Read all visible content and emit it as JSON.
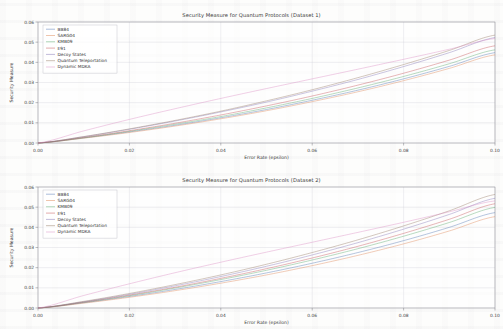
{
  "page": {
    "background": "#fdfdfc"
  },
  "figures": [
    {
      "id": "dataset-1",
      "title": "Security Measure for Quantum Protocols (Dataset 1)",
      "xlabel": "Error Rate (epsilon)",
      "ylabel": "Security Measure"
    },
    {
      "id": "dataset-2",
      "title": "Security Measure for Quantum Protocols (Dataset 2)",
      "xlabel": "Error Rate (epsilon)",
      "ylabel": "Security Measure"
    }
  ],
  "chart_data": [
    {
      "type": "line",
      "title": "Security Measure for Quantum Protocols (Dataset 1)",
      "xlabel": "Error Rate (epsilon)",
      "ylabel": "Security Measure",
      "xlim": [
        0.0,
        0.1
      ],
      "ylim": [
        0.0,
        0.06
      ],
      "xticks": [
        0.0,
        0.02,
        0.04,
        0.06,
        0.08,
        0.1
      ],
      "xticklabels": [
        "0.00",
        "0.02",
        "0.04",
        "0.06",
        "0.08",
        "0.10"
      ],
      "yticks": [
        0.0,
        0.01,
        0.02,
        0.03,
        0.04,
        0.05,
        0.06
      ],
      "yticklabels": [
        "0.00",
        "0.01",
        "0.02",
        "0.03",
        "0.04",
        "0.05",
        "0.06"
      ],
      "grid": true,
      "legend_position": "upper left",
      "x": [
        0.0,
        0.01,
        0.02,
        0.03,
        0.04,
        0.05,
        0.06,
        0.07,
        0.08,
        0.09,
        0.1
      ],
      "series": [
        {
          "name": "BB84",
          "color": "#4c72b0",
          "values": [
            0.0,
            0.0025,
            0.0055,
            0.0088,
            0.0125,
            0.0166,
            0.0212,
            0.0262,
            0.0318,
            0.038,
            0.0448
          ]
        },
        {
          "name": "SARG04",
          "color": "#dd8452",
          "values": [
            0.0,
            0.0024,
            0.0052,
            0.0084,
            0.012,
            0.016,
            0.0205,
            0.0254,
            0.0309,
            0.037,
            0.0437
          ]
        },
        {
          "name": "KMB09",
          "color": "#55a868",
          "values": [
            0.0,
            0.0026,
            0.0058,
            0.0093,
            0.0131,
            0.0174,
            0.0221,
            0.0273,
            0.033,
            0.0393,
            0.0462
          ]
        },
        {
          "name": "E91",
          "color": "#c44e52",
          "values": [
            0.0,
            0.0028,
            0.0061,
            0.0098,
            0.0139,
            0.0184,
            0.0233,
            0.0287,
            0.0346,
            0.0411,
            0.0482
          ]
        },
        {
          "name": "Decoy States",
          "color": "#8172b3",
          "values": [
            0.0,
            0.0031,
            0.0068,
            0.0109,
            0.0154,
            0.0203,
            0.0257,
            0.0315,
            0.0379,
            0.0448,
            0.0523
          ]
        },
        {
          "name": "Quantum Teleportation",
          "color": "#937860",
          "values": [
            0.0,
            0.0032,
            0.007,
            0.0112,
            0.0158,
            0.0209,
            0.0264,
            0.0324,
            0.0389,
            0.0459,
            0.0535
          ]
        },
        {
          "name": "Dynamic MDKA",
          "color": "#da8bc3",
          "values": [
            0.0,
            0.006,
            0.0117,
            0.017,
            0.0221,
            0.027,
            0.0318,
            0.0366,
            0.0415,
            0.0465,
            0.0518
          ]
        }
      ]
    },
    {
      "type": "line",
      "title": "Security Measure for Quantum Protocols (Dataset 2)",
      "xlabel": "Error Rate (epsilon)",
      "ylabel": "Security Measure",
      "xlim": [
        0.0,
        0.1
      ],
      "ylim": [
        0.0,
        0.06
      ],
      "xticks": [
        0.0,
        0.02,
        0.04,
        0.06,
        0.08,
        0.1
      ],
      "xticklabels": [
        "0.00",
        "0.02",
        "0.04",
        "0.06",
        "0.08",
        "0.10"
      ],
      "yticks": [
        0.0,
        0.01,
        0.02,
        0.03,
        0.04,
        0.05,
        0.06
      ],
      "yticklabels": [
        "0.00",
        "0.01",
        "0.02",
        "0.03",
        "0.04",
        "0.05",
        "0.06"
      ],
      "grid": true,
      "legend_position": "upper left",
      "x": [
        0.0,
        0.01,
        0.02,
        0.03,
        0.04,
        0.05,
        0.06,
        0.07,
        0.08,
        0.09,
        0.1
      ],
      "series": [
        {
          "name": "BB84",
          "color": "#4c72b0",
          "values": [
            0.0,
            0.0026,
            0.0057,
            0.0092,
            0.0131,
            0.0174,
            0.0222,
            0.0275,
            0.0334,
            0.04,
            0.0473
          ]
        },
        {
          "name": "SARG04",
          "color": "#dd8452",
          "values": [
            0.0,
            0.0024,
            0.0053,
            0.0086,
            0.0123,
            0.0164,
            0.021,
            0.0261,
            0.0318,
            0.0382,
            0.0453
          ]
        },
        {
          "name": "KMB09",
          "color": "#55a868",
          "values": [
            0.0,
            0.0028,
            0.0061,
            0.0099,
            0.0141,
            0.0187,
            0.0238,
            0.0294,
            0.0356,
            0.0424,
            0.0499
          ]
        },
        {
          "name": "E91",
          "color": "#c44e52",
          "values": [
            0.0,
            0.0029,
            0.0064,
            0.0103,
            0.0147,
            0.0195,
            0.0248,
            0.0306,
            0.037,
            0.044,
            0.0517
          ]
        },
        {
          "name": "Decoy States",
          "color": "#8172b3",
          "values": [
            0.0,
            0.0031,
            0.0068,
            0.011,
            0.0156,
            0.0207,
            0.0263,
            0.0324,
            0.0391,
            0.0464,
            0.0544
          ]
        },
        {
          "name": "Quantum Teleportation",
          "color": "#937860",
          "values": [
            0.0,
            0.0033,
            0.0072,
            0.0116,
            0.0164,
            0.0217,
            0.0275,
            0.0338,
            0.0407,
            0.0482,
            0.0563
          ]
        },
        {
          "name": "Dynamic MDKA",
          "color": "#da8bc3",
          "values": [
            0.0,
            0.0062,
            0.012,
            0.0175,
            0.0227,
            0.0277,
            0.0326,
            0.0375,
            0.0425,
            0.0477,
            0.0531
          ]
        }
      ]
    }
  ]
}
